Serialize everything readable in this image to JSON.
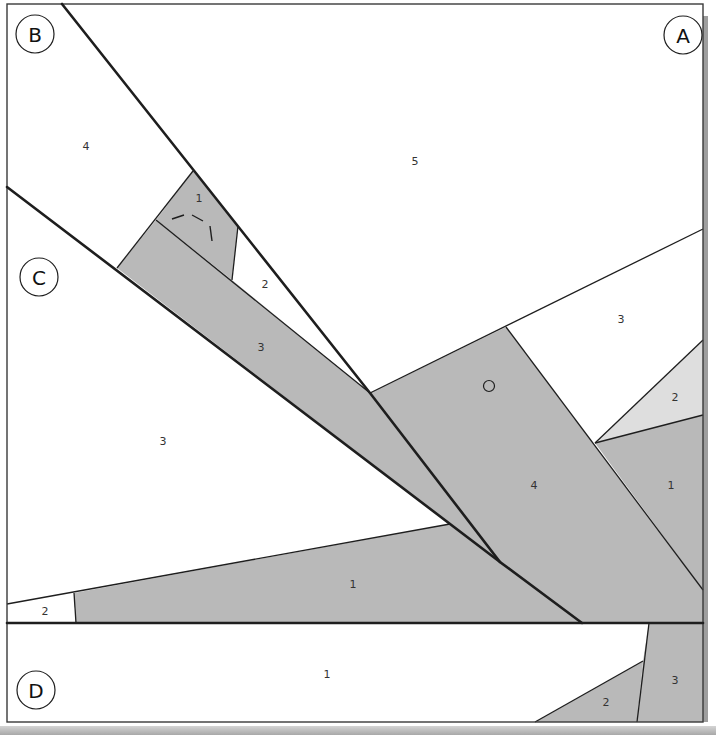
{
  "diagram": {
    "type": "foundation paper piecing pattern",
    "colors": {
      "gray": "#b9b9b9",
      "light_gray": "#dedede",
      "white": "#ffffff",
      "line": "#1e1e1e"
    },
    "sections": [
      {
        "label": "A",
        "pieces": [
          "5",
          "4",
          "3",
          "2",
          "1"
        ]
      },
      {
        "label": "B",
        "pieces": [
          "4",
          "1",
          "2",
          "3"
        ]
      },
      {
        "label": "C",
        "pieces": [
          "3",
          "1",
          "2"
        ]
      },
      {
        "label": "D",
        "pieces": [
          "1",
          "2",
          "3"
        ]
      }
    ],
    "labels": {
      "A": "A",
      "B": "B",
      "C": "C",
      "D": "D",
      "a5": "5",
      "a4": "4",
      "a3": "3",
      "a2": "2",
      "a1": "1",
      "b4": "4",
      "b1": "1",
      "b2": "2",
      "b3": "3",
      "c3": "3",
      "c1": "1",
      "c2": "2",
      "d1": "1",
      "d2": "2",
      "d3": "3"
    }
  }
}
